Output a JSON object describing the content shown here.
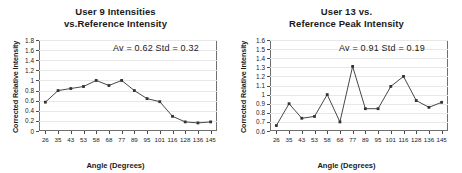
{
  "figure": {
    "panels": [
      {
        "name": "user-9",
        "title_lines": [
          "User 9 Intensities",
          "vs.Reference Intensity"
        ],
        "annotation": "Av = 0.62  Std = 0.32",
        "xlabel": "Angle (Degrees)",
        "ylabel": "Corrected Relative Intensity"
      },
      {
        "name": "user-13",
        "title_lines": [
          "User 13 vs.",
          "Reference Peak Intensity"
        ],
        "annotation": "Av = 0.91  Std = 0.19",
        "xlabel": "Angle (Degrees)",
        "ylabel": "Corrected Relative Intensity"
      }
    ]
  },
  "chart_data": [
    {
      "type": "line",
      "name": "user-9",
      "title": "User 9 Intensities vs.Reference Intensity",
      "xlabel": "Angle (Degrees)",
      "ylabel": "Corrected Relative Intensity",
      "categories": [
        "26",
        "35",
        "43",
        "53",
        "58",
        "68",
        "77",
        "89",
        "95",
        "101",
        "116",
        "128",
        "136",
        "145"
      ],
      "values": [
        0.57,
        0.8,
        0.84,
        0.88,
        1.0,
        0.9,
        1.0,
        0.8,
        0.64,
        0.58,
        0.29,
        0.18,
        0.16,
        0.18
      ],
      "yticks": [
        "0",
        "0.2",
        "0.4",
        "0.6",
        "0.8",
        "1",
        "1.2",
        "1.4",
        "1.6",
        "1.8"
      ],
      "ytick_values": [
        0,
        0.2,
        0.4,
        0.6,
        0.8,
        1.0,
        1.2,
        1.4,
        1.6,
        1.8
      ],
      "ylim": [
        0,
        1.8
      ],
      "grid": true,
      "legend": "none",
      "annotations": [
        {
          "text": "Av = 0.62  Std = 0.32",
          "av": 0.62,
          "std": 0.32
        }
      ],
      "marker": "square",
      "line_color": "#333333"
    },
    {
      "type": "line",
      "name": "user-13",
      "title": "User 13 vs. Reference Peak Intensity",
      "xlabel": "Angle (Degrees)",
      "ylabel": "Corrected Relative Intensity",
      "categories": [
        "26",
        "35",
        "43",
        "53",
        "58",
        "68",
        "77",
        "89",
        "95",
        "101",
        "116",
        "128",
        "136",
        "145"
      ],
      "values": [
        0.66,
        0.9,
        0.74,
        0.76,
        1.0,
        0.7,
        1.31,
        0.845,
        0.845,
        1.09,
        1.2,
        0.935,
        0.86,
        0.915
      ],
      "yticks": [
        "0.6",
        "0.7",
        "0.8",
        "0.9",
        "1",
        "1.1",
        "1.2",
        "1.3",
        "1.4",
        "1.5",
        "1.6"
      ],
      "ytick_values": [
        0.6,
        0.7,
        0.8,
        0.9,
        1.0,
        1.1,
        1.2,
        1.3,
        1.4,
        1.5,
        1.6
      ],
      "ylim": [
        0.6,
        1.6
      ],
      "grid": true,
      "legend": "none",
      "annotations": [
        {
          "text": "Av = 0.91  Std = 0.19",
          "av": 0.91,
          "std": 0.19
        }
      ],
      "marker": "square",
      "line_color": "#333333"
    }
  ]
}
